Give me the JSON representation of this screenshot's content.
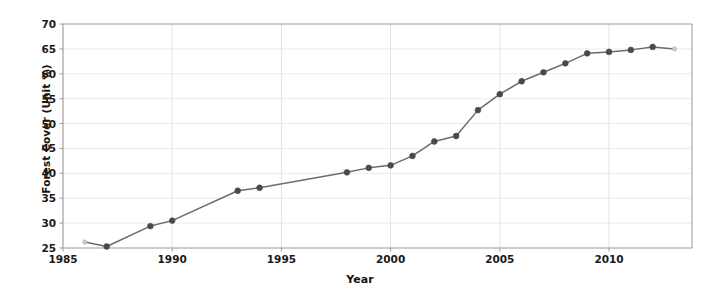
{
  "chart_data": {
    "type": "line",
    "title": "",
    "xlabel": "Year",
    "ylabel": "Forest Cover (Unit %)",
    "xlim": [
      1985,
      2013.8
    ],
    "ylim": [
      25,
      70
    ],
    "xticks": [
      1985,
      1990,
      1995,
      2000,
      2005,
      2010
    ],
    "yticks": [
      25,
      30,
      35,
      40,
      45,
      50,
      55,
      60,
      65,
      70
    ],
    "grid": true,
    "legend": null,
    "series": [
      {
        "name": "Forest Cover",
        "color": "#6b6b6b",
        "marker": "circle",
        "x": [
          1986,
          1987,
          1989,
          1990,
          1993,
          1994,
          1998,
          1999,
          2000,
          2001,
          2002,
          2003,
          2004,
          2005,
          2006,
          2007,
          2008,
          2009,
          2010,
          2011,
          2012,
          2013
        ],
        "y": [
          26.2,
          25.3,
          29.4,
          30.5,
          36.5,
          37.1,
          40.2,
          41.1,
          41.6,
          43.5,
          46.4,
          47.5,
          52.7,
          55.9,
          58.5,
          60.3,
          62.1,
          64.1,
          64.4,
          64.8,
          65.4,
          65.0
        ]
      }
    ],
    "annotations": []
  },
  "axis": {
    "ytick_labels": [
      "70",
      "65",
      "60",
      "55",
      "50",
      "45",
      "40",
      "35",
      "30",
      "25"
    ],
    "xtick_labels": [
      "1985",
      "1990",
      "1995",
      "2000",
      "2005",
      "2010"
    ],
    "x_axis_title": "Year",
    "y_axis_title": "Forest Cover (Unit %)"
  },
  "style": {
    "line_color": "#6b6b6b",
    "marker_color": "#4a4a4a",
    "grid_color": "#e4e4e4",
    "axis_color": "#9a9a9a",
    "text_color": "#141414",
    "background": "#ffffff"
  }
}
